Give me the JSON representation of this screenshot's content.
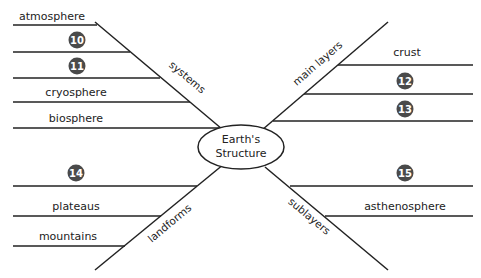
{
  "center": {
    "line1": "Earth's",
    "line2": "Structure"
  },
  "branches": {
    "systems": {
      "label": "systems",
      "items": [
        {
          "type": "text",
          "value": "atmosphere"
        },
        {
          "type": "number",
          "value": "10"
        },
        {
          "type": "number",
          "value": "11"
        },
        {
          "type": "text",
          "value": "cryosphere"
        },
        {
          "type": "text",
          "value": "biosphere"
        }
      ]
    },
    "main_layers": {
      "label": "main layers",
      "items": [
        {
          "type": "text",
          "value": "crust"
        },
        {
          "type": "number",
          "value": "12"
        },
        {
          "type": "number",
          "value": "13"
        }
      ]
    },
    "landforms": {
      "label": "landforms",
      "items": [
        {
          "type": "number",
          "value": "14"
        },
        {
          "type": "text",
          "value": "plateaus"
        },
        {
          "type": "text",
          "value": "mountains"
        }
      ]
    },
    "sublayers": {
      "label": "sublayers",
      "items": [
        {
          "type": "number",
          "value": "15"
        },
        {
          "type": "text",
          "value": "asthenosphere"
        }
      ]
    }
  },
  "colors": {
    "line": "#222222",
    "badge": "#4a4a4a",
    "background": "#ffffff"
  }
}
